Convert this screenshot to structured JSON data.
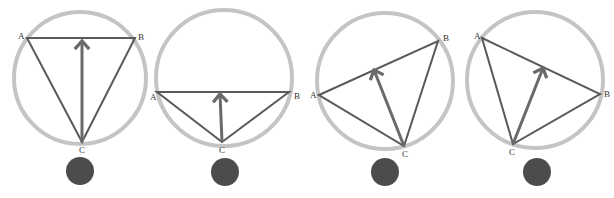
{
  "diagram": {
    "panels": [
      {
        "circle": {
          "cx": 80,
          "cy": 78,
          "r": 66
        },
        "A": {
          "x": 27,
          "y": 38,
          "label": "A",
          "lx": 18,
          "ly": 39
        },
        "B": {
          "x": 135,
          "y": 38,
          "label": "B",
          "lx": 138,
          "ly": 40
        },
        "C": {
          "x": 82,
          "y": 142,
          "label": "C",
          "lx": 79,
          "ly": 153
        },
        "arrow_tip": {
          "x": 82,
          "y": 41
        },
        "dot": {
          "cx": 80,
          "cy": 171,
          "r": 14
        }
      },
      {
        "circle": {
          "cx": 224,
          "cy": 78,
          "r": 68
        },
        "A": {
          "x": 157,
          "y": 92,
          "label": "A",
          "lx": 150,
          "ly": 100
        },
        "B": {
          "x": 289,
          "y": 92,
          "label": "B",
          "lx": 294,
          "ly": 99
        },
        "C": {
          "x": 222,
          "y": 142,
          "label": "C",
          "lx": 219,
          "ly": 153
        },
        "arrow_tip": {
          "x": 220,
          "y": 94
        },
        "dot": {
          "cx": 225,
          "cy": 172,
          "r": 14
        }
      },
      {
        "circle": {
          "cx": 385,
          "cy": 81,
          "r": 68
        },
        "A": {
          "x": 319,
          "y": 95,
          "label": "A",
          "lx": 310,
          "ly": 98
        },
        "B": {
          "x": 438,
          "y": 41,
          "label": "B",
          "lx": 443,
          "ly": 41
        },
        "C": {
          "x": 404,
          "y": 146,
          "label": "C",
          "lx": 402,
          "ly": 157
        },
        "arrow_tip": {
          "x": 374,
          "y": 70
        },
        "dot": {
          "cx": 385,
          "cy": 172,
          "r": 14
        }
      },
      {
        "circle": {
          "cx": 535,
          "cy": 80,
          "r": 68
        },
        "A": {
          "x": 482,
          "y": 38,
          "label": "A",
          "lx": 474,
          "ly": 39
        },
        "B": {
          "x": 600,
          "y": 94,
          "label": "B",
          "lx": 604,
          "ly": 97
        },
        "C": {
          "x": 513,
          "y": 144,
          "label": "C",
          "lx": 509,
          "ly": 155
        },
        "arrow_tip": {
          "x": 543,
          "y": 68
        },
        "dot": {
          "cx": 537,
          "cy": 172,
          "r": 14
        }
      }
    ],
    "colors": {
      "circle": "#c4c4c4",
      "edges": "#5a5a5a",
      "arrow": "#6a6a6a",
      "dot": "#4c4c4c"
    }
  }
}
